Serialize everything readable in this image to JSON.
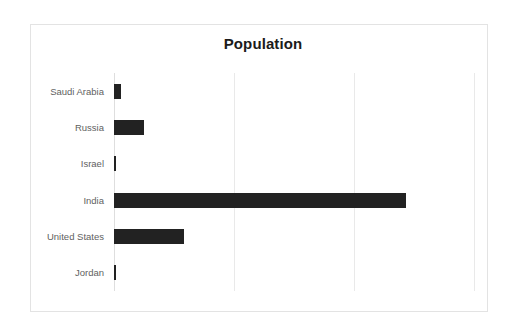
{
  "chart_data": {
    "type": "bar",
    "orientation": "horizontal",
    "title": "Population",
    "xlabel": "",
    "ylabel": "",
    "categories": [
      "Saudi Arabia",
      "Russia",
      "Israel",
      "India",
      "United States",
      "Jordan"
    ],
    "values": [
      35,
      144,
      9,
      1380,
      330,
      10
    ],
    "value_unit": "millions",
    "bar_pixel_widths": [
      8,
      39,
      2,
      292,
      79,
      2
    ],
    "xlim": [
      0,
      1700
    ],
    "x_gridline_values": [
      0,
      566,
      1133,
      1700
    ],
    "grid": true,
    "x_tick_labels_visible": false,
    "legend": false,
    "legend_position": "none",
    "series": [
      {
        "name": "Population",
        "color": "#222222",
        "values": [
          35,
          144,
          9,
          1380,
          330,
          10
        ]
      }
    ]
  },
  "style": {
    "bar_color": "#222222",
    "gridline_color": "#e9e9e9",
    "axis_color": "#dedede",
    "frame_border_color": "#e3e3e3",
    "label_color": "#5f5f5f",
    "title_color": "#1b1b1b",
    "background": "#ffffff"
  }
}
